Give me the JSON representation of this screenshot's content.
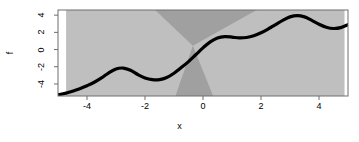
{
  "chart_data": {
    "type": "line",
    "title": "",
    "xlabel": "x",
    "ylabel": "f",
    "xlim": [
      -5,
      5
    ],
    "ylim": [
      -5.4,
      4.6
    ],
    "xticks": [
      -4,
      -2,
      0,
      2,
      4
    ],
    "xtick_labels": [
      "-4",
      "-2",
      "0",
      "2",
      "4"
    ],
    "yticks": [
      -4,
      -2,
      0,
      2,
      4
    ],
    "ytick_labels": [
      "-4",
      "-2",
      "0",
      "2",
      "4"
    ],
    "grid": false,
    "legend": null,
    "frame": true,
    "series": [
      {
        "name": "f",
        "kind": "line",
        "color": "#000000",
        "linewidth": 3.2,
        "x": [
          -5.0,
          -4.75,
          -4.5,
          -4.25,
          -4.0,
          -3.75,
          -3.5,
          -3.25,
          -3.0,
          -2.75,
          -2.5,
          -2.25,
          -2.0,
          -1.75,
          -1.5,
          -1.25,
          -1.0,
          -0.75,
          -0.5,
          -0.25,
          0.0,
          0.25,
          0.5,
          0.75,
          1.0,
          1.25,
          1.5,
          1.75,
          2.0,
          2.25,
          2.5,
          2.75,
          3.0,
          3.25,
          3.5,
          3.75,
          4.0,
          4.25,
          4.5,
          4.75,
          5.0
        ],
        "y": [
          -5.25,
          -5.1,
          -4.85,
          -4.55,
          -4.2,
          -3.8,
          -3.3,
          -2.7,
          -2.25,
          -2.15,
          -2.4,
          -2.9,
          -3.3,
          -3.5,
          -3.5,
          -3.25,
          -2.75,
          -2.1,
          -1.4,
          -0.6,
          0.2,
          0.9,
          1.35,
          1.5,
          1.45,
          1.35,
          1.4,
          1.6,
          1.95,
          2.4,
          2.9,
          3.4,
          3.8,
          3.95,
          3.8,
          3.4,
          2.95,
          2.6,
          2.45,
          2.55,
          2.9
        ]
      }
    ],
    "bands": [
      {
        "name": "outer-band",
        "kind": "band",
        "color": "#bfbfbf",
        "description": "light gray horizontal band spanning full vertical extent from x=-4.6 to x=4.85"
      },
      {
        "name": "bowtie-region",
        "kind": "band",
        "color": "#a0a0a0",
        "description": "darker gray hourglass/bowtie wedge crossing near x=-0.35"
      }
    ]
  },
  "colors": {
    "band_light": "#bfbfbf",
    "band_dark": "#a0a0a0",
    "curve": "#000000",
    "frame": "#6e6e6e",
    "background": "#ffffff",
    "text": "#000000"
  }
}
